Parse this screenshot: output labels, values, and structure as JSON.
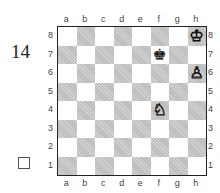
{
  "diagram": {
    "number": "14",
    "side_to_move_marker": "white",
    "files": [
      "a",
      "b",
      "c",
      "d",
      "e",
      "f",
      "g",
      "h"
    ],
    "ranks": [
      "8",
      "7",
      "6",
      "5",
      "4",
      "3",
      "2",
      "1"
    ],
    "colors": {
      "light": "#ffffff",
      "dark": "#b9b9b9",
      "border": "#222222"
    },
    "pieces": [
      {
        "square": "h8",
        "piece": "king",
        "color": "white",
        "glyph": "♔"
      },
      {
        "square": "f7",
        "piece": "king",
        "color": "black",
        "glyph": "♚"
      },
      {
        "square": "h6",
        "piece": "pawn",
        "color": "white",
        "glyph": "♙"
      },
      {
        "square": "f4",
        "piece": "knight",
        "color": "white",
        "glyph": "♘"
      }
    ]
  }
}
